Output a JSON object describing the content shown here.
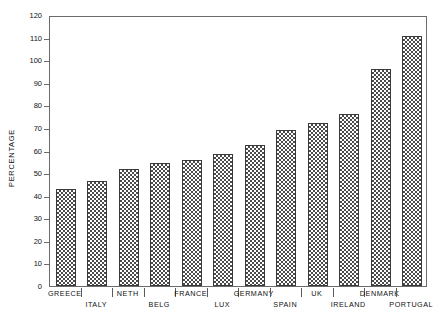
{
  "chart_data": {
    "type": "bar",
    "title": "",
    "subtitle": "",
    "xlabel": "",
    "ylabel": "PERCENTAGE",
    "ylim": [
      0,
      120
    ],
    "ytick_step": 10,
    "yticks": [
      0,
      10,
      20,
      30,
      40,
      50,
      60,
      70,
      80,
      90,
      100,
      110,
      120
    ],
    "grid": false,
    "legend": null,
    "bar_fill": "checkerboard-hatch",
    "bar_edge_color": "#3a3a3a",
    "bar_pattern_color": "#4a4a4a",
    "frame_color": "#6b6b6b",
    "background": "#ffffff",
    "categories": [
      "GREECE",
      "ITALY",
      "NETH",
      "BELG",
      "FRANCE",
      "LUX",
      "GERMANY",
      "SPAIN",
      "UK",
      "IRELAND",
      "DENMARK",
      "PORTUGAL"
    ],
    "values": [
      43,
      46.5,
      52,
      54.5,
      56,
      58.5,
      62.5,
      69,
      72,
      76,
      96,
      110.5
    ],
    "category_label_rows": [
      0,
      1,
      0,
      1,
      0,
      1,
      0,
      1,
      0,
      1,
      0,
      1
    ]
  }
}
